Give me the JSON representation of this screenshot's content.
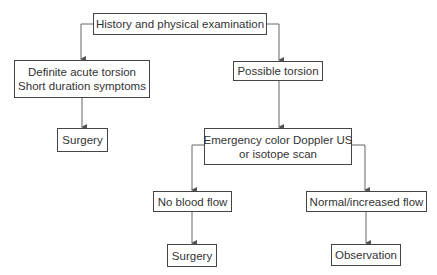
{
  "diagram": {
    "type": "flowchart",
    "nodes": {
      "history": {
        "label": "History and physical examination"
      },
      "definite": {
        "line1": "Definite acute torsion",
        "line2": "Short duration symptoms"
      },
      "possible": {
        "label": "Possible torsion"
      },
      "surgery_left": {
        "label": "Surgery"
      },
      "emergency": {
        "line1": "Emergency color Doppler US",
        "line2": "or isotope scan"
      },
      "no_flow": {
        "label": "No blood flow"
      },
      "normal_flow": {
        "label": "Normal/increased flow"
      },
      "surgery_bottom": {
        "label": "Surgery"
      },
      "observation": {
        "label": "Observation"
      }
    },
    "edges": [
      [
        "history",
        "definite"
      ],
      [
        "history",
        "possible"
      ],
      [
        "definite",
        "surgery_left"
      ],
      [
        "possible",
        "emergency"
      ],
      [
        "emergency",
        "no_flow"
      ],
      [
        "emergency",
        "normal_flow"
      ],
      [
        "no_flow",
        "surgery_bottom"
      ],
      [
        "normal_flow",
        "observation"
      ]
    ],
    "colors": {
      "line": "#555555",
      "border": "#444444",
      "text": "#333333"
    }
  }
}
